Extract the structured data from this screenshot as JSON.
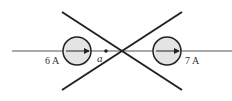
{
  "diagram": {
    "colors": {
      "line": "#222222",
      "wire": "#555555",
      "circle_fill": "#e4e4e4",
      "text": "#333333"
    },
    "labels": {
      "left_current": "6 A",
      "point": "a",
      "right_current": "7 A"
    },
    "elements": {
      "left_element": "circular element with rightward arrow",
      "right_element": "circular element with rightward arrow",
      "crossing_lines": "two crossed lines forming an X"
    }
  }
}
